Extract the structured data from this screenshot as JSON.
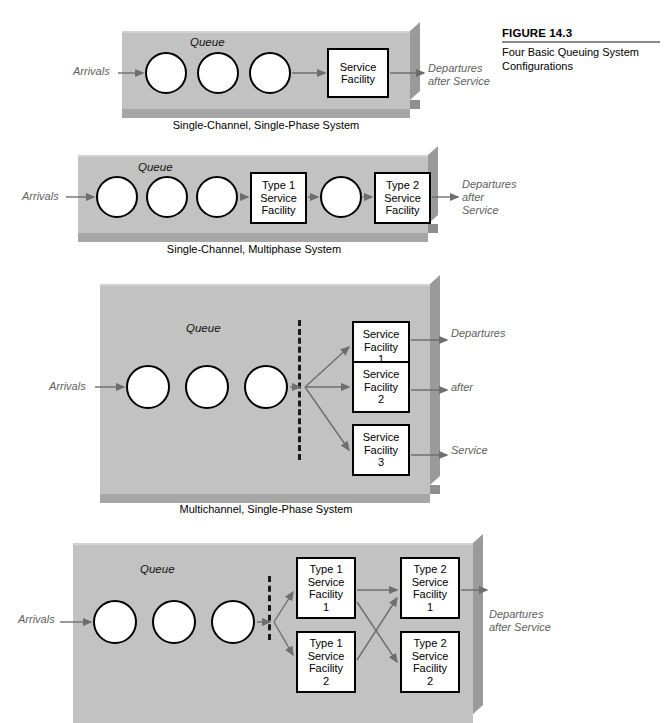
{
  "figure": {
    "number": "FIGURE 14.3",
    "caption_line1": "Four Basic Queuing System",
    "caption_line2": "Configurations",
    "rule_color": "#8a8a8a"
  },
  "palette": {
    "slab_face": "#c2c2c2",
    "slab_side": "#9a9a9a",
    "slab_bottom": "#aaaaaa",
    "box_fill": "#ffffff",
    "box_stroke": "#000000",
    "flow_text": "#5e5e5e",
    "arrow": "#6e6e6e",
    "dash": "#1a1a1a"
  },
  "common": {
    "queue_label": "Queue",
    "arrivals_label": "Arrivals"
  },
  "diagrams": [
    {
      "id": "single-channel-single-phase",
      "caption": "Single-Channel, Single-Phase System",
      "queue_label": "Queue",
      "arrivals_label": "Arrivals",
      "queue_circles": 3,
      "facilities": [
        {
          "lines": [
            "Service",
            "Facility"
          ]
        }
      ],
      "departure_lines": [
        "Departures",
        "after Service"
      ]
    },
    {
      "id": "single-channel-multiphase",
      "caption": "Single-Channel, Multiphase System",
      "queue_label": "Queue",
      "arrivals_label": "Arrivals",
      "queue_circles": 3,
      "mid_circles": 1,
      "facilities": [
        {
          "lines": [
            "Type 1",
            "Service",
            "Facility"
          ]
        },
        {
          "lines": [
            "Type 2",
            "Service",
            "Facility"
          ]
        }
      ],
      "departure_lines": [
        "Departures",
        "after",
        "Service"
      ]
    },
    {
      "id": "multichannel-single-phase",
      "caption": "Multichannel, Single-Phase System",
      "queue_label": "Queue",
      "arrivals_label": "Arrivals",
      "queue_circles": 3,
      "facilities": [
        {
          "lines": [
            "Service",
            "Facility",
            "1"
          ]
        },
        {
          "lines": [
            "Service",
            "Facility",
            "2"
          ]
        },
        {
          "lines": [
            "Service",
            "Facility",
            "3"
          ]
        }
      ],
      "departure_lines": [
        "Departures",
        "after",
        "Service"
      ]
    },
    {
      "id": "multichannel-multiphase",
      "caption": "",
      "queue_label": "Queue",
      "arrivals_label": "Arrivals",
      "queue_circles": 3,
      "facilities": [
        {
          "lines": [
            "Type 1",
            "Service",
            "Facility",
            "1"
          ]
        },
        {
          "lines": [
            "Type 2",
            "Service",
            "Facility",
            "1"
          ]
        },
        {
          "lines": [
            "Type 1",
            "Service",
            "Facility",
            "2"
          ]
        },
        {
          "lines": [
            "Type 2",
            "Service",
            "Facility",
            "2"
          ]
        }
      ],
      "departure_lines": [
        "Departures",
        "after Service"
      ]
    }
  ]
}
